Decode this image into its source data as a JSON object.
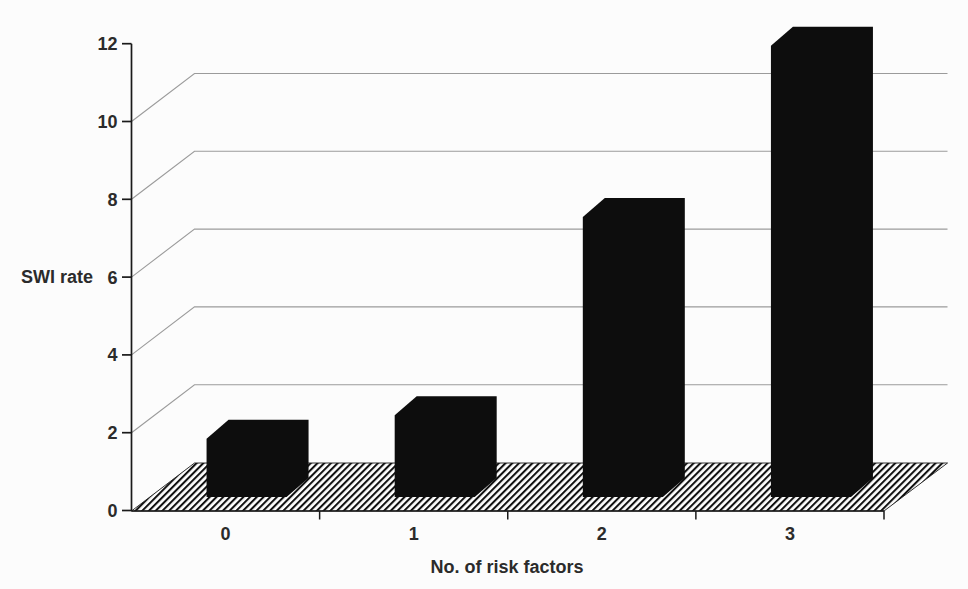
{
  "figure": {
    "background": "#fcfcfc"
  },
  "chart_data": {
    "type": "bar",
    "projection": "3d-oblique",
    "title": "",
    "xlabel": "No. of risk factors",
    "ylabel": "SWI rate",
    "categories": [
      "0",
      "1",
      "2",
      "3"
    ],
    "values": [
      1.5,
      2.1,
      7.2,
      11.6
    ],
    "yticks": [
      0,
      2,
      4,
      6,
      8,
      10,
      12
    ],
    "ylim": [
      0,
      12
    ],
    "grid": true,
    "legend": false,
    "bar_color": "#0d0d0d",
    "gridline_color": "#9b9b9b",
    "axis_color": "#1a1a1a",
    "text_color": "#2b2b2b",
    "floor_hatch_color": "#111111",
    "floor_hatch": "diagonal-stripes"
  }
}
